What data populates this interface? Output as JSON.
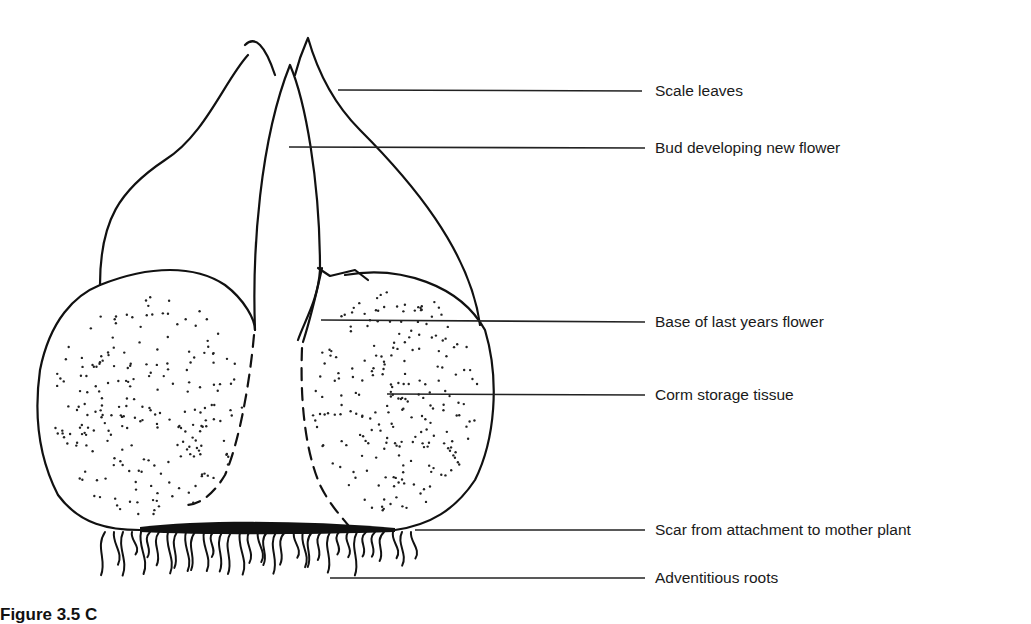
{
  "figure": {
    "caption_visible": "Figure 3.5  C",
    "labels": [
      {
        "id": "scale-leaves",
        "text": "Scale leaves"
      },
      {
        "id": "bud-developing-new-flower",
        "text": "Bud developing new flower"
      },
      {
        "id": "base-of-last-years-flower",
        "text": "Base of last years flower"
      },
      {
        "id": "corm-storage-tissue",
        "text": "Corm storage tissue"
      },
      {
        "id": "scar-from-attachment",
        "text": "Scar from attachment to mother plant"
      },
      {
        "id": "adventitious-roots",
        "text": "Adventitious roots"
      }
    ],
    "colors": {
      "ink": "#111111",
      "background": "#ffffff"
    }
  }
}
